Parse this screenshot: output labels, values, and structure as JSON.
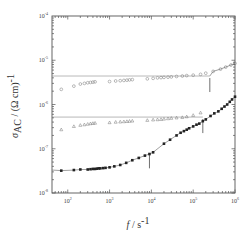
{
  "chart_data": {
    "type": "scatter",
    "title": "",
    "xlabel": "f / s^-1",
    "ylabel": "σ_AC / (Ω cm)^-1",
    "xscale": "log",
    "yscale": "log",
    "xlim": [
      42,
      1000000
    ],
    "ylim": [
      1e-08,
      0.0001
    ],
    "x_ticks": [
      {
        "value": 100,
        "base": "10",
        "exp": "2"
      },
      {
        "value": 1000,
        "base": "10",
        "exp": "3"
      },
      {
        "value": 10000,
        "base": "10",
        "exp": "4"
      },
      {
        "value": 100000,
        "base": "10",
        "exp": "5"
      },
      {
        "value": 1000000,
        "base": "10",
        "exp": "6"
      }
    ],
    "y_ticks": [
      {
        "value": 0.0001,
        "base": "10",
        "exp": "-4"
      },
      {
        "value": 1e-05,
        "base": "10",
        "exp": "-5"
      },
      {
        "value": 1e-06,
        "base": "10",
        "exp": "-6"
      },
      {
        "value": 1e-07,
        "base": "10",
        "exp": "-7"
      },
      {
        "value": 1e-08,
        "base": "10",
        "exp": "-8"
      }
    ],
    "grid": false,
    "legend": null,
    "series": [
      {
        "name": "open circles",
        "marker": "open-circle",
        "dc_plateau": 4.4e-06,
        "arrow_at_f": 250000,
        "x": [
          70,
          140,
          200,
          250,
          300,
          350,
          400,
          450,
          1000,
          1400,
          1800,
          2200,
          2600,
          3000,
          3500,
          8000,
          11000,
          14000,
          17000,
          20000,
          25000,
          30000,
          40000,
          55000,
          70000,
          100000,
          150000,
          200000,
          300000,
          450000,
          600000,
          800000,
          1000000
        ],
        "y": [
          2.2e-06,
          2.6e-06,
          2.9e-06,
          3e-06,
          3.1e-06,
          3.15e-06,
          3.2e-06,
          3.25e-06,
          3.3e-06,
          3.4e-06,
          3.45e-06,
          3.5e-06,
          3.55e-06,
          3.6e-06,
          3.65e-06,
          3.8e-06,
          3.9e-06,
          4e-06,
          4.05e-06,
          4.1e-06,
          4.15e-06,
          4.2e-06,
          4.3e-06,
          4.4e-06,
          4.5e-06,
          4.6e-06,
          4.8e-06,
          5.1e-06,
          5.6e-06,
          6.3e-06,
          7e-06,
          7.8e-06,
          8.5e-06
        ]
      },
      {
        "name": "open triangles",
        "marker": "open-triangle",
        "dc_plateau": 5.2e-07,
        "arrow_at_f": 170000,
        "x": [
          70,
          140,
          200,
          250,
          300,
          350,
          400,
          450,
          1000,
          1400,
          1800,
          2200,
          2600,
          3000,
          3500,
          8000,
          11000,
          14000,
          17000,
          20000,
          25000,
          30000,
          40000,
          55000,
          70000,
          100000,
          150000
        ],
        "y": [
          2.7e-07,
          3.2e-07,
          3.4e-07,
          3.5e-07,
          3.6e-07,
          3.7e-07,
          3.75e-07,
          3.8e-07,
          3.9e-07,
          4e-07,
          4.05e-07,
          4.1e-07,
          4.15e-07,
          4.2e-07,
          4.25e-07,
          4.4e-07,
          4.5e-07,
          4.55e-07,
          4.6e-07,
          4.7e-07,
          4.8e-07,
          4.9e-07,
          5e-07,
          5.1e-07,
          5.3e-07,
          5.7e-07,
          6.5e-07
        ]
      },
      {
        "name": "filled squares",
        "marker": "filled-square",
        "dc_plateau": 3.3e-08,
        "arrow_at_f": 9000,
        "x": [
          70,
          140,
          200,
          300,
          350,
          400,
          450,
          500,
          550,
          600,
          700,
          800,
          1000,
          1300,
          1800,
          2500,
          3500,
          5000,
          7000,
          9000,
          11000,
          20000,
          28000,
          40000,
          50000,
          60000,
          70000,
          80000,
          100000,
          120000,
          140000,
          170000,
          200000,
          260000,
          320000,
          400000,
          480000,
          560000,
          650000,
          750000,
          850000,
          1000000
        ],
        "y": [
          3.2e-08,
          3.3e-08,
          3.4e-08,
          3.4e-08,
          3.45e-08,
          3.5e-08,
          3.5e-08,
          3.55e-08,
          3.6e-08,
          3.6e-08,
          3.65e-08,
          3.7e-08,
          3.8e-08,
          4e-08,
          4.3e-08,
          4.8e-08,
          5.5e-08,
          6.2e-08,
          7e-08,
          7.6e-08,
          8.3e-08,
          1.3e-07,
          1.6e-07,
          2e-07,
          2.3e-07,
          2.5e-07,
          2.7e-07,
          2.9e-07,
          3.2e-07,
          3.5e-07,
          3.7e-07,
          4.2e-07,
          4.6e-07,
          5.5e-07,
          6.3e-07,
          7e-07,
          8e-07,
          9e-07,
          1e-06,
          1.15e-06,
          1.3e-06,
          1.5e-06
        ]
      }
    ]
  },
  "labels": {
    "x_axis_title_f": "f",
    "x_axis_title_unit": " / s",
    "x_axis_title_exp": "-1",
    "y_axis_title_sigma": "σ",
    "y_axis_title_sub": "AC",
    "y_axis_title_unit": " / (Ω cm)",
    "y_axis_title_exp": "-1"
  }
}
